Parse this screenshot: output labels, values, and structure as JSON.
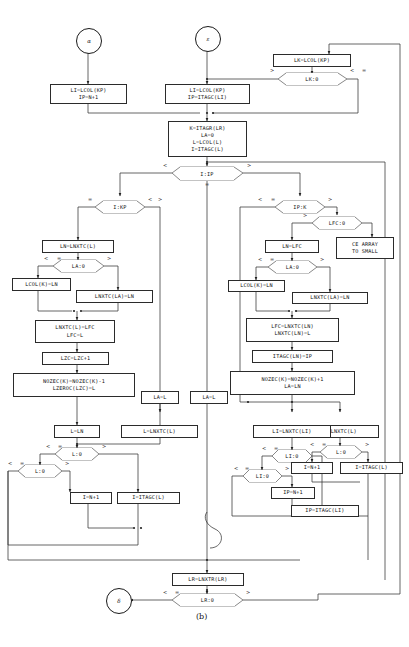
{
  "figure": {
    "caption": "(b)"
  },
  "terminals": [
    {
      "name": "alpha",
      "label": "α"
    },
    {
      "name": "epsilon",
      "label": "ε"
    },
    {
      "name": "delta",
      "label": "δ"
    }
  ],
  "process_boxes": [
    {
      "id": "b_lk_lcol",
      "lines": [
        "LK=LCOL(KP)"
      ]
    },
    {
      "id": "b_li_lcol_np1",
      "lines": [
        "LI=LCOL(KP)",
        "IP=N+1"
      ]
    },
    {
      "id": "b_li_lcol_itagc",
      "lines": [
        "LI=LCOL(KP)",
        "IP=ITAGC(LI)"
      ]
    },
    {
      "id": "b_k_itagr",
      "lines": [
        "K=ITAGR(LR)",
        "LA=0",
        "L=LCOL(L)",
        "I=ITAGC(L)"
      ]
    },
    {
      "id": "b_ln_lnxtc",
      "lines": [
        "LN=LNXTC(L)"
      ]
    },
    {
      "id": "b_lcol_k_ln_l",
      "lines": [
        "LCOL(K)=LN"
      ]
    },
    {
      "id": "b_lnxtc_la_ln_l",
      "lines": [
        "LNXTC(LA)=LN"
      ]
    },
    {
      "id": "b_lnxtc_l_lfc",
      "lines": [
        "LNXTC(L)=LFC",
        "LFC=L"
      ]
    },
    {
      "id": "b_lzc",
      "lines": [
        "LZC=LZC+1"
      ]
    },
    {
      "id": "b_nozec_minus",
      "lines": [
        "NOZEC(K)=NOZEC(K)-1",
        "LZEROC(LZC)=L"
      ]
    },
    {
      "id": "b_l_ln",
      "lines": [
        "L=LN"
      ]
    },
    {
      "id": "b_l_lnxtc_mid",
      "lines": [
        "L=LNXTC(L)"
      ]
    },
    {
      "id": "b_la_l_left",
      "lines": [
        "LA=L"
      ]
    },
    {
      "id": "b_la_l_mid",
      "lines": [
        "LA=L"
      ]
    },
    {
      "id": "b_i_np1_left",
      "lines": [
        "I=N+1"
      ]
    },
    {
      "id": "b_i_itagc_left",
      "lines": [
        "I=ITAGC(L)"
      ]
    },
    {
      "id": "b_ln_lfc",
      "lines": [
        "LN=LFC"
      ]
    },
    {
      "id": "b_ce_array",
      "lines": [
        "CE ARRAY",
        "TO SMALL"
      ]
    },
    {
      "id": "b_lcol_k_ln_r",
      "lines": [
        "LCOL(K)=LN"
      ]
    },
    {
      "id": "b_lnxtc_la_ln_r",
      "lines": [
        "LNXTC(LA)=LN"
      ]
    },
    {
      "id": "b_lfc_lnxtc_ln",
      "lines": [
        "LFC=LNXTC(LN)",
        "LNXTC(LN)=L"
      ]
    },
    {
      "id": "b_itagc_ln_ip",
      "lines": [
        "ITAGC(LN)=IP"
      ]
    },
    {
      "id": "b_nozec_plus",
      "lines": [
        "NOZEC(K)=NOZEC(K)+1",
        "LA=LN"
      ]
    },
    {
      "id": "b_l_lnxtc_right",
      "lines": [
        "L=LNXTC(L)"
      ]
    },
    {
      "id": "b_li_lnxtc_li",
      "lines": [
        "LI=LNXTC(LI)"
      ]
    },
    {
      "id": "b_i_np1_right",
      "lines": [
        "I=N+1"
      ]
    },
    {
      "id": "b_i_itagc_right",
      "lines": [
        "I=ITAGC(L)"
      ]
    },
    {
      "id": "b_ip_np1",
      "lines": [
        "IP=N+1"
      ]
    },
    {
      "id": "b_ip_itagc_li",
      "lines": [
        "IP=ITAGC(LI)"
      ]
    },
    {
      "id": "b_lr_lnxtr",
      "lines": [
        "LR=LNXTR(LR)"
      ]
    }
  ],
  "decisions": [
    {
      "id": "d_lk0",
      "label": "LK:0",
      "left": ">",
      "right_a": "<",
      "right_b": "=",
      "bottom": ""
    },
    {
      "id": "d_iip",
      "label": "I:IP",
      "left": "<",
      "right_a": ">",
      "right_b": "",
      "bottom": "="
    },
    {
      "id": "d_ikp",
      "label": "I:KP",
      "left": "=",
      "right_a": "<",
      "right_b": ">",
      "bottom": ""
    },
    {
      "id": "d_la0_l",
      "label": "LA:0",
      "left": "<",
      "right_a": "=",
      "right_b": ">",
      "bottom": ""
    },
    {
      "id": "d_l0_a",
      "label": "L:0",
      "left": "<",
      "right_a": "=",
      "right_b": ">",
      "bottom": ""
    },
    {
      "id": "d_l0_b",
      "label": "L:0",
      "left": "<",
      "right_a": "=",
      "right_b": ">",
      "bottom": ""
    },
    {
      "id": "d_ipk",
      "label": "IP:K",
      "left": "<",
      "right_a": "=",
      "right_b": ">",
      "bottom": ""
    },
    {
      "id": "d_lfc0",
      "label": "LFC:0",
      "left": ">",
      "right_a": "",
      "right_b": "",
      "bottom": ""
    },
    {
      "id": "d_la0_r",
      "label": "LA:0",
      "left": "<",
      "right_a": "=",
      "right_b": ">",
      "bottom": ""
    },
    {
      "id": "d_l0_r",
      "label": "L:0",
      "left": "<",
      "right_a": "=",
      "right_b": ">",
      "bottom": ""
    },
    {
      "id": "d_li0_a",
      "label": "LI:0",
      "left": "<",
      "right_a": "=",
      "right_b": "",
      "bottom": ""
    },
    {
      "id": "d_li0_b",
      "label": "LI:0",
      "left": "<",
      "right_a": "=",
      "right_b": ">",
      "bottom": ""
    },
    {
      "id": "d_lr0",
      "label": "LR:0",
      "left": "<",
      "right_a": "=",
      "right_b": ">",
      "bottom": ""
    }
  ]
}
